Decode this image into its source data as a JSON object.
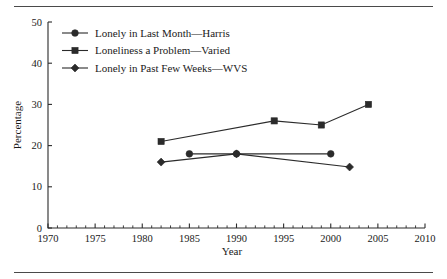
{
  "figure": {
    "has_top_rule": true,
    "has_bottom_rule": true,
    "background_color": "#ffffff",
    "ink_color": "#2b2b2b"
  },
  "chart_data": {
    "type": "line",
    "title": "",
    "xlabel": "Year",
    "ylabel": "Percentage",
    "xlim": [
      1970,
      2010
    ],
    "ylim": [
      0,
      50
    ],
    "x_major_ticks": [
      1970,
      1975,
      1980,
      1985,
      1990,
      1995,
      2000,
      2005,
      2010
    ],
    "x_tick_labels": [
      "1970",
      "1975",
      "1980",
      "1985",
      "1990",
      "1995",
      "2000",
      "2005",
      "2010"
    ],
    "x_minor_tick_step": 1,
    "y_major_ticks": [
      0,
      10,
      20,
      30,
      40,
      50
    ],
    "y_tick_labels": [
      "0",
      "10",
      "20",
      "30",
      "40",
      "50"
    ],
    "grid": false,
    "legend_position": "top-left",
    "series": [
      {
        "name": "Lonely in Last Month—Harris",
        "marker": "circle",
        "x": [
          1985,
          1990,
          2000
        ],
        "values": [
          18,
          18,
          18
        ]
      },
      {
        "name": "Loneliness a Problem—Varied",
        "marker": "square",
        "x": [
          1982,
          1994,
          1999,
          2004
        ],
        "values": [
          21,
          26,
          25,
          30
        ]
      },
      {
        "name": "Lonely in Past Few Weeks—WVS",
        "marker": "diamond",
        "x": [
          1982,
          1990,
          2002
        ],
        "values": [
          16,
          18,
          14.8
        ]
      }
    ]
  }
}
